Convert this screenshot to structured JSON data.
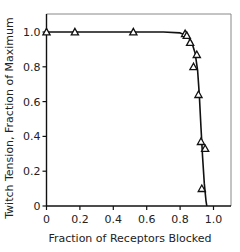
{
  "chart_data": {
    "type": "scatter",
    "title": "",
    "xlabel": "Fraction of Receptors Blocked",
    "ylabel": "Twitch Tension, Fraction of Maximum",
    "xlim": [
      0,
      1.1
    ],
    "ylim": [
      0,
      1.1
    ],
    "x_ticks": [
      "0",
      "0.2",
      "0.4",
      "0.6",
      "0.8",
      "1.0"
    ],
    "y_ticks": [
      "0",
      "0.2",
      "0.4",
      "0.6",
      "0.8",
      "1.0"
    ],
    "grid": false,
    "legend": null,
    "series": [
      {
        "name": "Measured",
        "marker": "triangle-open",
        "x": [
          0.0,
          0.17,
          0.52,
          0.83,
          0.84,
          0.86,
          0.9,
          0.88,
          0.91,
          0.925,
          0.95,
          0.93
        ],
        "y": [
          1.0,
          1.0,
          1.0,
          0.99,
          0.98,
          0.94,
          0.87,
          0.8,
          0.64,
          0.37,
          0.33,
          0.1
        ]
      },
      {
        "name": "Fitted curve",
        "type": "line",
        "x": [
          0.0,
          0.7,
          0.8,
          0.84,
          0.87,
          0.89,
          0.905,
          0.915,
          0.925,
          0.935,
          0.945,
          0.955,
          0.96
        ],
        "y": [
          1.0,
          1.0,
          0.995,
          0.98,
          0.94,
          0.88,
          0.78,
          0.64,
          0.45,
          0.28,
          0.13,
          0.03,
          0.0
        ]
      }
    ]
  }
}
